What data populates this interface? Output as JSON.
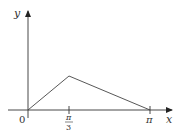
{
  "diagram": {
    "type": "function-graph",
    "axes": {
      "x_label": "x",
      "y_label": "y",
      "origin_label": "0"
    },
    "ticks": [
      {
        "label_num": "π",
        "label_den": "3",
        "value": "π/3"
      },
      {
        "label": "π",
        "value": "π"
      }
    ],
    "curve": {
      "kind": "piecewise-linear",
      "points": [
        {
          "x": "0",
          "y": 0
        },
        {
          "x": "π/3",
          "y": "peak"
        },
        {
          "x": "π",
          "y": 0
        }
      ]
    },
    "colors": {
      "axis": "#333333",
      "curve": "#444444"
    }
  }
}
